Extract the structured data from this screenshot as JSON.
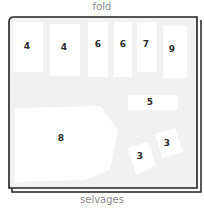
{
  "diagram": {
    "type": "sewing-pattern-layout",
    "top_label": "fold",
    "bottom_label": "selvages",
    "colors": {
      "fabric": "#f1f1f1",
      "piece": "#ffffff",
      "outline": "#222222",
      "label": "#8a8a8a"
    },
    "pieces": [
      {
        "id": "4",
        "x": 27,
        "y": 46
      },
      {
        "id": "4",
        "x": 64,
        "y": 47
      },
      {
        "id": "6",
        "x": 98,
        "y": 44
      },
      {
        "id": "6",
        "x": 123,
        "y": 44
      },
      {
        "id": "7",
        "x": 146,
        "y": 44
      },
      {
        "id": "9",
        "x": 172,
        "y": 49
      },
      {
        "id": "5",
        "x": 150,
        "y": 102
      },
      {
        "id": "8",
        "x": 61,
        "y": 138
      },
      {
        "id": "3",
        "x": 140,
        "y": 156
      },
      {
        "id": "3",
        "x": 167,
        "y": 143
      }
    ]
  }
}
